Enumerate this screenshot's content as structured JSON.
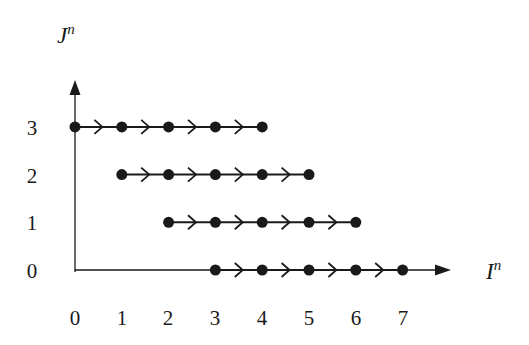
{
  "diagram": {
    "x_axis": {
      "title": "I",
      "superscript": "n",
      "ticks": [
        "0",
        "1",
        "2",
        "3",
        "4",
        "5",
        "6",
        "7"
      ]
    },
    "y_axis": {
      "title": "J",
      "superscript": "n",
      "ticks": [
        "0",
        "1",
        "2",
        "3"
      ]
    },
    "rows": [
      {
        "j": 3,
        "i_start": 0,
        "i_end": 4
      },
      {
        "j": 2,
        "i_start": 1,
        "i_end": 5
      },
      {
        "j": 1,
        "i_start": 2,
        "i_end": 6
      },
      {
        "j": 0,
        "i_start": 3,
        "i_end": 7
      }
    ],
    "colors": {
      "ink": "#1a1a1a",
      "background": "#ffffff"
    }
  }
}
